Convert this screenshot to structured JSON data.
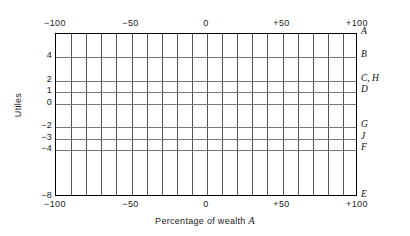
{
  "chart_data": {
    "type": "line",
    "title": "",
    "xlabel": "Percentage of wealth A",
    "ylabel": "Utiles",
    "xlim": [
      -100,
      100
    ],
    "ylim": [
      -8,
      6
    ],
    "grid": true,
    "legend": "right-edge-annotations",
    "x_tick_labels": [
      "−100",
      "−50",
      "0",
      "+50",
      "+100"
    ],
    "x_tick_values": [
      -100,
      -50,
      0,
      50,
      100
    ],
    "x_gridline_step": 10,
    "x_gridline_count": 21,
    "y_tick_labels": [
      "4",
      "2",
      "1",
      "0",
      "−2",
      "−3",
      "−4",
      "−8"
    ],
    "y_tick_values": [
      4,
      2,
      1,
      0,
      -2,
      -3,
      -4,
      -8
    ],
    "y_gridline_values": [
      4,
      2,
      1,
      0,
      -2,
      -3,
      -4
    ],
    "series": [
      {
        "name": "A",
        "value": 6,
        "label": "A"
      },
      {
        "name": "B",
        "value": 4,
        "label": "B"
      },
      {
        "name": "C, H",
        "value": 2,
        "label": "C, H"
      },
      {
        "name": "D",
        "value": 1,
        "label": "D"
      },
      {
        "name": "G",
        "value": -2,
        "label": "G"
      },
      {
        "name": "J",
        "value": -3,
        "label": "J"
      },
      {
        "name": "F",
        "value": -4,
        "label": "F"
      },
      {
        "name": "E",
        "value": -8,
        "label": "E"
      }
    ],
    "right_edge_labels": [
      "A",
      "B",
      "C, H",
      "D",
      "G",
      "J",
      "F",
      "E"
    ],
    "colors": {
      "frame": "#000000",
      "gridline_vertical": "#555555",
      "gridline_horizontal": "#777777",
      "background": "#ffffff",
      "text": "#1a1a1a"
    }
  },
  "axis": {
    "x_title_text": "Percentage of wealth ",
    "x_title_variable": "A",
    "y_title": "Utiles"
  },
  "xticks_top": [
    {
      "label": "−100",
      "value": -100
    },
    {
      "label": "−50",
      "value": -50
    },
    {
      "label": "0",
      "value": 0
    },
    {
      "label": "+50",
      "value": 50
    },
    {
      "label": "+100",
      "value": 100
    }
  ],
  "xticks_bottom": [
    {
      "label": "−100",
      "value": -100
    },
    {
      "label": "−50",
      "value": -50
    },
    {
      "label": "0",
      "value": 0
    },
    {
      "label": "+50",
      "value": 50
    },
    {
      "label": "+100",
      "value": 100
    }
  ],
  "yticks": [
    {
      "label": "4",
      "value": 4
    },
    {
      "label": "2",
      "value": 2
    },
    {
      "label": "1",
      "value": 1
    },
    {
      "label": "0",
      "value": 0
    },
    {
      "label": "−2",
      "value": -2
    },
    {
      "label": "−3",
      "value": -3
    },
    {
      "label": "−4",
      "value": -4
    },
    {
      "label": "−8",
      "value": -8
    }
  ],
  "right_labels": [
    {
      "label": "A",
      "value": 6
    },
    {
      "label": "B",
      "value": 4
    },
    {
      "label": "C, H",
      "value": 2
    },
    {
      "label": "D",
      "value": 1
    },
    {
      "label": "G",
      "value": -2
    },
    {
      "label": "J",
      "value": -3
    },
    {
      "label": "F",
      "value": -4
    },
    {
      "label": "E",
      "value": -8
    }
  ]
}
